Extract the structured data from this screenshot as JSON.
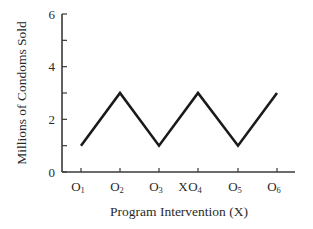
{
  "chart_data": {
    "type": "line",
    "title": "",
    "xlabel": "Program Intervention (X)",
    "ylabel": "Millions of Condoms Sold",
    "categories": [
      "O1",
      "O2",
      "O3",
      "O4",
      "O5",
      "O6"
    ],
    "category_labels": [
      {
        "base": "O",
        "sub": "1"
      },
      {
        "base": "O",
        "sub": "2"
      },
      {
        "base": "O",
        "sub": "3"
      },
      {
        "base": "O",
        "sub": "4"
      },
      {
        "base": "O",
        "sub": "5"
      },
      {
        "base": "O",
        "sub": "6"
      }
    ],
    "annotations": [
      {
        "text": "X",
        "position": "between O3 and O4"
      }
    ],
    "series": [
      {
        "name": "Condoms Sold",
        "values": [
          1,
          3,
          1,
          3,
          1,
          3
        ],
        "color": "#1a1a1a"
      }
    ],
    "y_ticks": [
      0,
      1,
      2,
      3,
      4,
      5,
      6
    ],
    "y_tick_labels": [
      "0",
      "",
      "2",
      "",
      "4",
      "",
      "6"
    ],
    "ylim": [
      0,
      6
    ],
    "grid": false,
    "legend": "none"
  }
}
